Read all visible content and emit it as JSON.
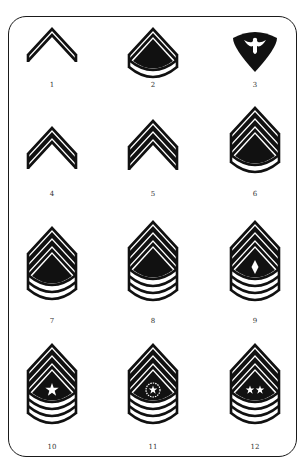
{
  "colors": {
    "ink": "#111111",
    "paper": "#ffffff",
    "frame": "#1a1a1a"
  },
  "insignia": [
    {
      "number": "1",
      "chevrons": 1,
      "rockers": 0,
      "center": "none",
      "type": "chevron",
      "label_x": 52,
      "label_y": 82,
      "cx": 52,
      "top": 29
    },
    {
      "number": "2",
      "chevrons": 1,
      "rockers": 1,
      "center": "none",
      "type": "chevron",
      "label_x": 153,
      "label_y": 82,
      "cx": 153,
      "top": 29
    },
    {
      "number": "3",
      "chevrons": 0,
      "rockers": 0,
      "center": "eagle",
      "type": "specialist",
      "label_x": 255,
      "label_y": 82,
      "cx": 255,
      "top": 32
    },
    {
      "number": "4",
      "chevrons": 2,
      "rockers": 0,
      "center": "none",
      "type": "chevron",
      "label_x": 52,
      "label_y": 191,
      "cx": 52,
      "top": 128
    },
    {
      "number": "5",
      "chevrons": 3,
      "rockers": 0,
      "center": "none",
      "type": "chevron",
      "label_x": 153,
      "label_y": 191,
      "cx": 153,
      "top": 121
    },
    {
      "number": "6",
      "chevrons": 3,
      "rockers": 1,
      "center": "none",
      "type": "chevron",
      "label_x": 255,
      "label_y": 191,
      "cx": 255,
      "top": 108
    },
    {
      "number": "7",
      "chevrons": 3,
      "rockers": 2,
      "center": "none",
      "type": "chevron",
      "label_x": 52,
      "label_y": 318,
      "cx": 52,
      "top": 228
    },
    {
      "number": "8",
      "chevrons": 3,
      "rockers": 3,
      "center": "none",
      "type": "chevron",
      "label_x": 153,
      "label_y": 318,
      "cx": 153,
      "top": 222
    },
    {
      "number": "9",
      "chevrons": 3,
      "rockers": 3,
      "center": "diamond",
      "type": "chevron",
      "label_x": 255,
      "label_y": 318,
      "cx": 255,
      "top": 222
    },
    {
      "number": "10",
      "chevrons": 3,
      "rockers": 3,
      "center": "star",
      "type": "chevron",
      "label_x": 52,
      "label_y": 444,
      "cx": 52,
      "top": 345
    },
    {
      "number": "11",
      "chevrons": 3,
      "rockers": 3,
      "center": "eagle-wreath",
      "type": "chevron",
      "label_x": 153,
      "label_y": 444,
      "cx": 153,
      "top": 345
    },
    {
      "number": "12",
      "chevrons": 3,
      "rockers": 3,
      "center": "two-stars",
      "type": "chevron",
      "label_x": 255,
      "label_y": 444,
      "cx": 255,
      "top": 345
    }
  ]
}
